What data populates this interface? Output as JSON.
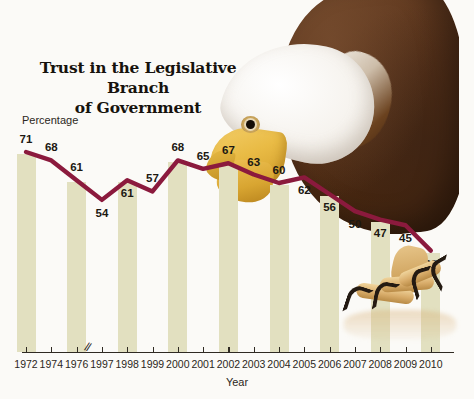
{
  "chart": {
    "title_line1": "Trust in the Legislative Branch",
    "title_line2": "of Government",
    "ylabel": "Percentage",
    "xlabel": "Year",
    "axis_break_glyph": "//",
    "line_color": "#8B1A3D",
    "band_color": "#E2E0C0",
    "background_color": "#FBFAF7"
  },
  "chart_data": {
    "type": "line",
    "title": "Trust in the Legislative Branch of Government",
    "xlabel": "Year",
    "ylabel": "Percentage",
    "ylim": [
      0,
      75
    ],
    "grid": false,
    "legend": null,
    "axis_break_between": [
      "1976",
      "1997"
    ],
    "categories": [
      "1972",
      "1974",
      "1976",
      "1997",
      "1998",
      "1999",
      "2000",
      "2001",
      "2002",
      "2003",
      "2004",
      "2005",
      "2006",
      "2007",
      "2008",
      "2009",
      "2010"
    ],
    "values": [
      71,
      68,
      61,
      54,
      61,
      57,
      68,
      65,
      67,
      63,
      60,
      62,
      56,
      50,
      47,
      45,
      36
    ],
    "point_labels": [
      "71",
      "68",
      "61",
      "54",
      "61",
      "57",
      "68",
      "65",
      "67",
      "63",
      "60",
      "62",
      "56",
      "50",
      "47",
      "45",
      "36"
    ],
    "label_placement": [
      "above",
      "above",
      "above",
      "below",
      "below",
      "above",
      "above",
      "above",
      "above",
      "above",
      "above",
      "below",
      "below",
      "below",
      "below",
      "below",
      "below"
    ]
  },
  "artwork": {
    "subject": "bald-eagle",
    "description_parts": [
      "eagle-head",
      "eagle-beak",
      "eagle-eye",
      "eagle-body",
      "eagle-talons",
      "talon-reflection"
    ]
  }
}
